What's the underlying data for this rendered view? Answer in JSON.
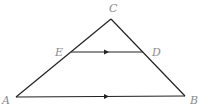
{
  "diagram": {
    "type": "triangle-with-parallel-segment",
    "stroke_color": "#222222",
    "label_color": "#8a8a8a",
    "points": {
      "A": {
        "label": "A",
        "x": 16,
        "y": 97
      },
      "B": {
        "label": "B",
        "x": 185,
        "y": 96
      },
      "C": {
        "label": "C",
        "x": 111,
        "y": 19
      },
      "D": {
        "label": "D",
        "x": 143,
        "y": 52
      },
      "E": {
        "label": "E",
        "x": 71,
        "y": 52
      }
    },
    "segments": [
      "AC",
      "CB",
      "AB",
      "ED"
    ],
    "parallel_marks": [
      "ED",
      "AB"
    ]
  }
}
